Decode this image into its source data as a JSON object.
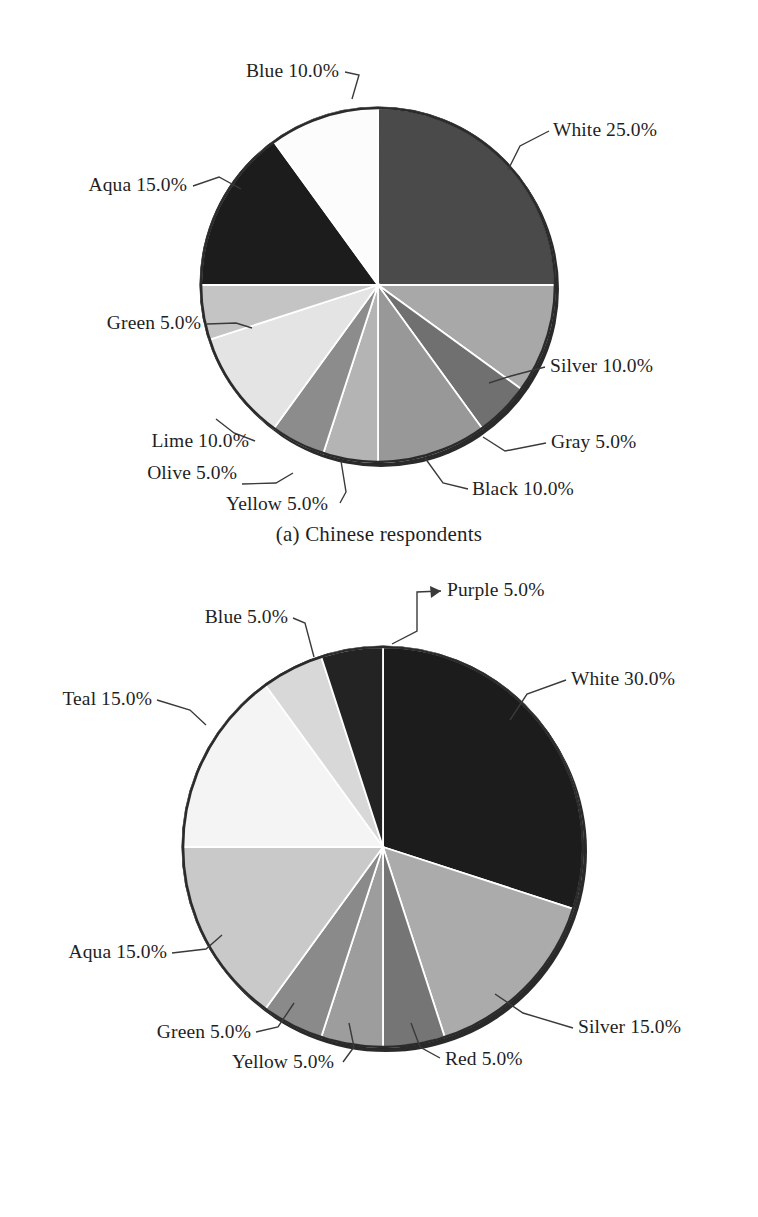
{
  "figure": {
    "background": "#ffffff",
    "label_color": "#1f1f1f",
    "leader_color": "#3a3a3a"
  },
  "panels": [
    {
      "id": "a",
      "caption": "(a) Chinese respondents",
      "center": [
        378,
        285
      ],
      "radius": 177
    },
    {
      "id": "b",
      "caption": "(b) Czech respondents",
      "center": [
        383,
        847
      ],
      "radius": 200
    }
  ],
  "chart_data": [
    {
      "type": "pie",
      "title": "(a) Chinese respondents",
      "subtitle": "",
      "xlabel": "",
      "ylabel": "",
      "start_angle_deg": 0,
      "direction": "clockwise",
      "units": "percent",
      "total": 100.0,
      "legend_position": "none (direct labels with leader lines)",
      "labels": [
        "White 25.0%",
        "Silver 10.0%",
        "Gray 5.0%",
        "Black 10.0%",
        "Yellow 5.0%",
        "Olive 5.0%",
        "Lime 10.0%",
        "Green 5.0%",
        "Aqua 15.0%",
        "Blue 10.0%"
      ],
      "categories": [
        "White",
        "Silver",
        "Gray",
        "Black",
        "Yellow",
        "Olive",
        "Lime",
        "Green",
        "Aqua",
        "Blue"
      ],
      "values": [
        25.0,
        10.0,
        5.0,
        10.0,
        5.0,
        5.0,
        10.0,
        5.0,
        15.0,
        10.0
      ],
      "slice_fills": [
        "#4a4a4a",
        "#a8a8a8",
        "#707070",
        "#989898",
        "#b4b4b4",
        "#8c8c8c",
        "#e4e4e4",
        "#c4c4c4",
        "#1c1c1c",
        "#fcfcfc"
      ]
    },
    {
      "type": "pie",
      "title": "(b) Czech respondents",
      "subtitle": "",
      "xlabel": "",
      "ylabel": "",
      "start_angle_deg": 0,
      "direction": "clockwise",
      "units": "percent",
      "total": 100.0,
      "legend_position": "none (direct labels with leader lines)",
      "labels": [
        "White 30.0%",
        "Silver 15.0%",
        "Red 5.0%",
        "Yellow 5.0%",
        "Green 5.0%",
        "Aqua 15.0%",
        "Teal 15.0%",
        "Blue 5.0%",
        "Purple 5.0%"
      ],
      "categories": [
        "White",
        "Silver",
        "Red",
        "Yellow",
        "Green",
        "Aqua",
        "Teal",
        "Blue",
        "Purple"
      ],
      "values": [
        30.0,
        15.0,
        5.0,
        5.0,
        5.0,
        15.0,
        15.0,
        5.0,
        5.0
      ],
      "slice_fills": [
        "#1c1c1c",
        "#ababab",
        "#757575",
        "#9d9d9d",
        "#8a8a8a",
        "#c9c9c9",
        "#f4f4f4",
        "#d8d8d8",
        "#232323"
      ]
    }
  ],
  "panel_a_labels": {
    "white": "White 25.0%",
    "silver": "Silver 10.0%",
    "gray": "Gray 5.0%",
    "black": "Black 10.0%",
    "yellow": "Yellow 5.0%",
    "olive": "Olive 5.0%",
    "lime": "Lime 10.0%",
    "green": "Green 5.0%",
    "aqua": "Aqua 15.0%",
    "blue": "Blue 10.0%"
  },
  "panel_b_labels": {
    "white": "White 30.0%",
    "silver": "Silver 15.0%",
    "red": "Red 5.0%",
    "yellow": "Yellow 5.0%",
    "green": "Green 5.0%",
    "aqua": "Aqua 15.0%",
    "teal": "Teal 15.0%",
    "blue": "Blue 5.0%",
    "purple": "Purple 5.0%"
  },
  "captions": {
    "a": "(a) Chinese respondents",
    "b": "(b) Czech respondents"
  }
}
